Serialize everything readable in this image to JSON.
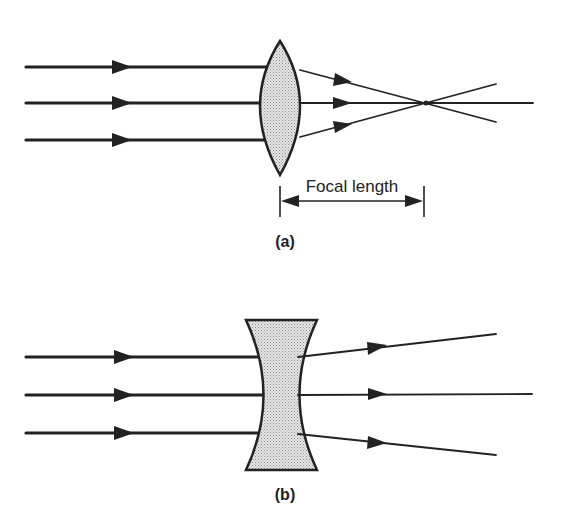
{
  "diagram": {
    "panel_a": {
      "caption": "(a)",
      "lens_type": "converging (convex)",
      "dimension_label": "Focal length",
      "rays": 3
    },
    "panel_b": {
      "caption": "(b)",
      "lens_type": "diverging (concave)",
      "rays": 3
    },
    "colors": {
      "ink": "#222222",
      "lens_fill": "#d9d9d9",
      "background": "#ffffff"
    }
  }
}
